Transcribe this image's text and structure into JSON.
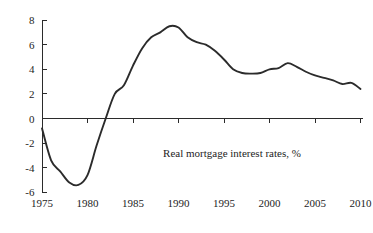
{
  "chart_data": {
    "type": "line",
    "title": "",
    "annotation": "Real mortgage interest rates, %",
    "xlabel": "",
    "ylabel": "",
    "xlim": [
      1975,
      2010
    ],
    "ylim": [
      -6,
      8
    ],
    "grid": false,
    "legend": "none",
    "zero_line": true,
    "line_color": "#2b2b2b",
    "axis_color": "#2b2b2b",
    "background_color": "#ffffff",
    "x_ticks": [
      1975,
      1980,
      1985,
      1990,
      1995,
      2000,
      2005,
      2010
    ],
    "x_tick_labels": [
      "1975",
      "1980",
      "1985",
      "1990",
      "1995",
      "2000",
      "2005",
      "2010"
    ],
    "y_ticks": [
      -6,
      -4,
      -2,
      0,
      2,
      4,
      6,
      8
    ],
    "y_tick_labels": [
      "-6",
      "-4",
      "-2",
      "0",
      "2",
      "4",
      "6",
      "8"
    ],
    "series": [
      {
        "name": "Real mortgage interest rates",
        "x": [
          1975,
          1976,
          1977,
          1978,
          1979,
          1980,
          1981,
          1982,
          1983,
          1984,
          1985,
          1986,
          1987,
          1988,
          1989,
          1990,
          1991,
          1992,
          1993,
          1994,
          1995,
          1996,
          1997,
          1998,
          1999,
          2000,
          2001,
          2002,
          2003,
          2004,
          2005,
          2006,
          2007,
          2008,
          2009,
          2010
        ],
        "values": [
          -0.8,
          -3.4,
          -4.3,
          -5.2,
          -5.4,
          -4.6,
          -2.2,
          0.0,
          2.0,
          2.7,
          4.3,
          5.7,
          6.6,
          7.0,
          7.5,
          7.4,
          6.6,
          6.2,
          6.0,
          5.5,
          4.8,
          4.0,
          3.7,
          3.65,
          3.7,
          4.0,
          4.1,
          4.5,
          4.2,
          3.8,
          3.5,
          3.3,
          3.1,
          2.8,
          2.9,
          2.4
        ]
      }
    ]
  }
}
